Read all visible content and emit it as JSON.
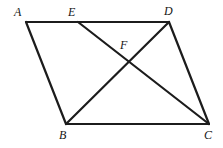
{
  "figure": {
    "canvas": {
      "width": 223,
      "height": 148,
      "background": "#ffffff"
    },
    "style": {
      "stroke_color": "#1c1c1c",
      "stroke_width": 2,
      "label_color": "#151515",
      "label_font_size": 12,
      "label_style": "italic-serif"
    },
    "points": [
      {
        "id": "A",
        "label": "A",
        "x": 26,
        "y": 22,
        "label_x": 14,
        "label_y": 6,
        "kind": "vertex"
      },
      {
        "id": "E",
        "label": "E",
        "x": 78,
        "y": 22,
        "label_x": 68,
        "label_y": 6,
        "kind": "point-on-segment"
      },
      {
        "id": "D",
        "label": "D",
        "x": 169,
        "y": 22,
        "label_x": 164,
        "label_y": 5,
        "kind": "vertex"
      },
      {
        "id": "F",
        "label": "F",
        "x": 128,
        "y": 63,
        "label_x": 120,
        "label_y": 39,
        "kind": "intersection"
      },
      {
        "id": "B",
        "label": "B",
        "x": 66,
        "y": 124,
        "label_x": 59,
        "label_y": 129,
        "kind": "vertex"
      },
      {
        "id": "C",
        "label": "C",
        "x": 209,
        "y": 124,
        "label_x": 204,
        "label_y": 129,
        "kind": "vertex"
      }
    ],
    "segments": [
      {
        "id": "AD",
        "from": "A",
        "to": "D",
        "name": "segment-ad-top-edge"
      },
      {
        "id": "AB",
        "from": "A",
        "to": "B",
        "name": "segment-ab-left-edge"
      },
      {
        "id": "BC",
        "from": "B",
        "to": "C",
        "name": "segment-bc-bottom-edge"
      },
      {
        "id": "DC",
        "from": "D",
        "to": "C",
        "name": "segment-dc-right-edge"
      },
      {
        "id": "EC",
        "from": "E",
        "to": "C",
        "name": "segment-ec-cevian"
      },
      {
        "id": "BD",
        "from": "B",
        "to": "D",
        "name": "segment-bd-diagonal"
      }
    ]
  }
}
